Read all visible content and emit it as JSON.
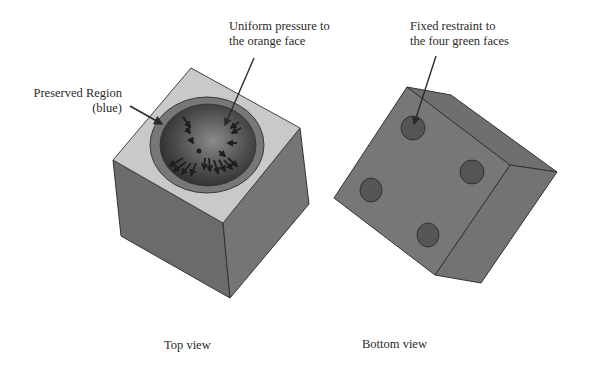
{
  "annotations": {
    "preserved_region": {
      "line1": "Preserved Region",
      "line2": "(blue)"
    },
    "uniform_pressure": {
      "line1": "Uniform pressure to",
      "line2": "the orange face"
    },
    "fixed_restraint": {
      "line1": "Fixed restraint to",
      "line2": "the four green faces"
    }
  },
  "captions": {
    "top_view": "Top view",
    "bottom_view": "Bottom view"
  },
  "colors": {
    "cube_top_face": "#c9c9c9",
    "cube_left_face": "#6b6b6b",
    "cube_right_face": "#757575",
    "preserved_ring": "#777777",
    "pressure_face_center": "#7a7a7a",
    "pressure_face_edge": "#2e2e2e",
    "bottom_face": "#777777",
    "restraint_disk": "#555555",
    "arrow": "#2b2b2b"
  }
}
